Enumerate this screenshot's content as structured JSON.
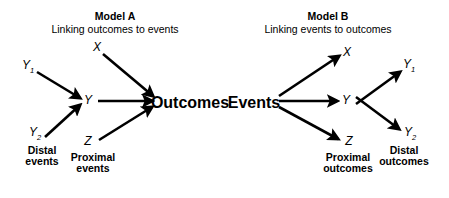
{
  "figure": {
    "background_color": "#ffffff",
    "ink_color": "#000000"
  },
  "models": [
    {
      "id": "model-a",
      "title": "Model A",
      "subtitle": "Linking outcomes to events",
      "title_x": 115,
      "nodes": [
        {
          "name": "y1",
          "label": "Y",
          "sub": "1",
          "x": 28,
          "y": 67,
          "style": "italic"
        },
        {
          "name": "y2",
          "label": "Y",
          "sub": "2",
          "x": 35,
          "y": 134,
          "style": "italic"
        },
        {
          "name": "x",
          "label": "X",
          "sub": "",
          "x": 97,
          "y": 47,
          "style": "italic"
        },
        {
          "name": "y",
          "label": "Y",
          "sub": "",
          "x": 88,
          "y": 100,
          "style": "italic"
        },
        {
          "name": "z",
          "label": "Z",
          "sub": "",
          "x": 88,
          "y": 141,
          "style": "italic"
        },
        {
          "name": "outcomes",
          "label": "Outcomes",
          "sub": "",
          "x": 190,
          "y": 103,
          "style": "bold"
        }
      ],
      "captions": [
        {
          "name": "distal-events",
          "lines": [
            "Distal",
            "events"
          ],
          "x": 42,
          "y": 145
        },
        {
          "name": "proximal-events",
          "lines": [
            "Proximal",
            "events"
          ],
          "x": 93,
          "y": 152
        }
      ],
      "arrows": [
        {
          "name": "arrow-y1-to-y",
          "from": [
            37,
            72
          ],
          "to": [
            80,
            98
          ]
        },
        {
          "name": "arrow-y2-to-y",
          "from": [
            45,
            137
          ],
          "to": [
            80,
            105
          ]
        },
        {
          "name": "arrow-x-to-outcomes",
          "from": [
            103,
            54
          ],
          "to": [
            153,
            96
          ]
        },
        {
          "name": "arrow-y-to-outcomes",
          "from": [
            98,
            101
          ],
          "to": [
            152,
            101
          ]
        },
        {
          "name": "arrow-z-to-outcomes",
          "from": [
            99,
            140
          ],
          "to": [
            152,
            107
          ]
        }
      ]
    },
    {
      "id": "model-b",
      "title": "Model B",
      "subtitle": "Linking events to outcomes",
      "title_x": 328,
      "nodes": [
        {
          "name": "events",
          "label": "Events",
          "sub": "",
          "x": 254,
          "y": 103
        },
        {
          "name": "x",
          "label": "X",
          "sub": "",
          "x": 347,
          "y": 52,
          "style": "italic"
        },
        {
          "name": "y",
          "label": "Y",
          "sub": "",
          "x": 346,
          "y": 100,
          "style": "italic"
        },
        {
          "name": "z",
          "label": "Z",
          "sub": "",
          "x": 349,
          "y": 141,
          "style": "italic"
        },
        {
          "name": "y1",
          "label": "Y",
          "sub": "1",
          "x": 409,
          "y": 66,
          "style": "italic"
        },
        {
          "name": "y2",
          "label": "Y",
          "sub": "2",
          "x": 410,
          "y": 134,
          "style": "italic"
        }
      ],
      "captions": [
        {
          "name": "proximal-outcomes",
          "lines": [
            "Proximal",
            "outcomes"
          ],
          "x": 348,
          "y": 152
        },
        {
          "name": "distal-outcomes",
          "lines": [
            "Distal",
            "outcomes"
          ],
          "x": 404,
          "y": 145
        }
      ],
      "arrows": [
        {
          "name": "arrow-events-to-x",
          "from": [
            279,
            96
          ],
          "to": [
            339,
            56
          ]
        },
        {
          "name": "arrow-events-to-y",
          "from": [
            279,
            101
          ],
          "to": [
            337,
            101
          ]
        },
        {
          "name": "arrow-events-to-z",
          "from": [
            279,
            107
          ],
          "to": [
            338,
            139
          ]
        },
        {
          "name": "arrow-y-to-y1",
          "from": [
            356,
            104
          ],
          "to": [
            400,
            72
          ]
        },
        {
          "name": "arrow-y-to-y2",
          "from": [
            356,
            97
          ],
          "to": [
            399,
            129
          ]
        }
      ]
    }
  ]
}
